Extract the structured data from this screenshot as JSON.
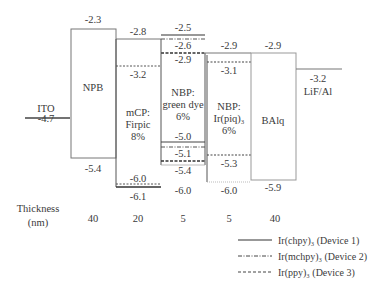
{
  "diagram": {
    "type": "energy-level-diagram",
    "electrodes": {
      "anode": {
        "name": "ITO",
        "value": "-4.7"
      },
      "cathode": {
        "name": "LiF/Al",
        "value": "-3.2"
      }
    },
    "layers": [
      {
        "name": "NPB",
        "lumo": "-2.3",
        "homo": "-5.4",
        "thickness": "40"
      },
      {
        "name_line1": "mCP:",
        "name_line2": "Firpic",
        "name_line3": "8%",
        "lumo": "-2.8",
        "lumo_dopant": "-3.2",
        "homo_dopant": "-6.0",
        "homo": "-6.1",
        "thickness": "20"
      },
      {
        "name_line1": "NBP:",
        "name_line2": "green dye",
        "name_line3": "6%",
        "lumo_d1": "-2.5",
        "lumo_d2": "-2.6",
        "lumo_d3": "-2.9",
        "homo_d1": "-5.0",
        "homo_d2": "-5.1",
        "homo_d3": "-5.4",
        "homo": "-6.0",
        "thickness": "5"
      },
      {
        "name_line1": "NBP:",
        "name_line2": "Ir(piq)₃",
        "name_line3": "6%",
        "lumo": "-2.9",
        "lumo_dopant": "-3.1",
        "homo_dopant": "-5.3",
        "homo": "-6.0",
        "thickness": "5"
      },
      {
        "name": "BAlq",
        "lumo": "-2.9",
        "homo": "-5.9",
        "thickness": "40"
      }
    ],
    "thickness_label_line1": "Thickness",
    "thickness_label_line2": "(nm)",
    "legend": [
      {
        "style": "solid",
        "label": "Ir(chpy)₃ (Device 1)"
      },
      {
        "style": "dash-dot",
        "label": "Ir(mchpy)₃ (Device 2)"
      },
      {
        "style": "dashed",
        "label": "Ir(ppy)₃ (Device 3)"
      }
    ],
    "line_color": "#555555"
  }
}
